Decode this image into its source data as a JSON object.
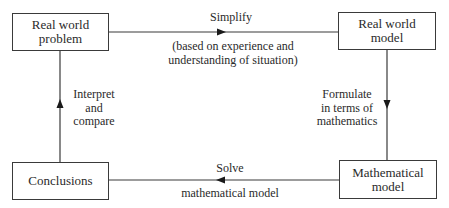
{
  "diagram": {
    "nodes": {
      "real_world_problem": {
        "line1": "Real world",
        "line2": "problem"
      },
      "real_world_model": {
        "line1": "Real world",
        "line2": "model"
      },
      "mathematical_model": {
        "line1": "Mathematical",
        "line2": "model"
      },
      "conclusions": {
        "line1": "Conclusions"
      }
    },
    "edges": {
      "simplify": {
        "label": "Simplify",
        "note_line1": "(based on experience and",
        "note_line2": "understanding of situation)"
      },
      "formulate": {
        "line1": "Formulate",
        "line2": "in terms of",
        "line3": "mathematics"
      },
      "solve": {
        "label": "Solve",
        "note": "mathematical model"
      },
      "interpret": {
        "line1": "Interpret",
        "line2": "and",
        "line3": "compare"
      }
    }
  }
}
